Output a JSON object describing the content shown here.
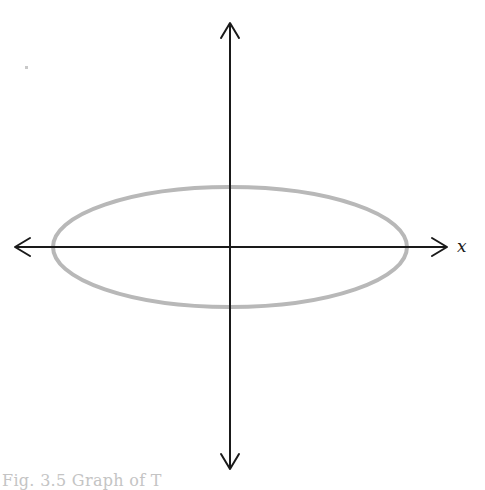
{
  "figure": {
    "type": "ellipse-graph",
    "axes": {
      "x_label": "x",
      "y_label": "",
      "origin": {
        "x": 230,
        "y": 247
      },
      "x_axis": {
        "from": 14,
        "to": 448
      },
      "y_axis": {
        "from": 22,
        "to": 470
      },
      "color": "#1a1a1a"
    },
    "curve": {
      "shape": "ellipse",
      "center": {
        "x": 230,
        "y": 247
      },
      "rx": 177,
      "ry": 60,
      "stroke": "#b8b8b8"
    },
    "caption": "Fig. 3.5 Graph of T"
  }
}
